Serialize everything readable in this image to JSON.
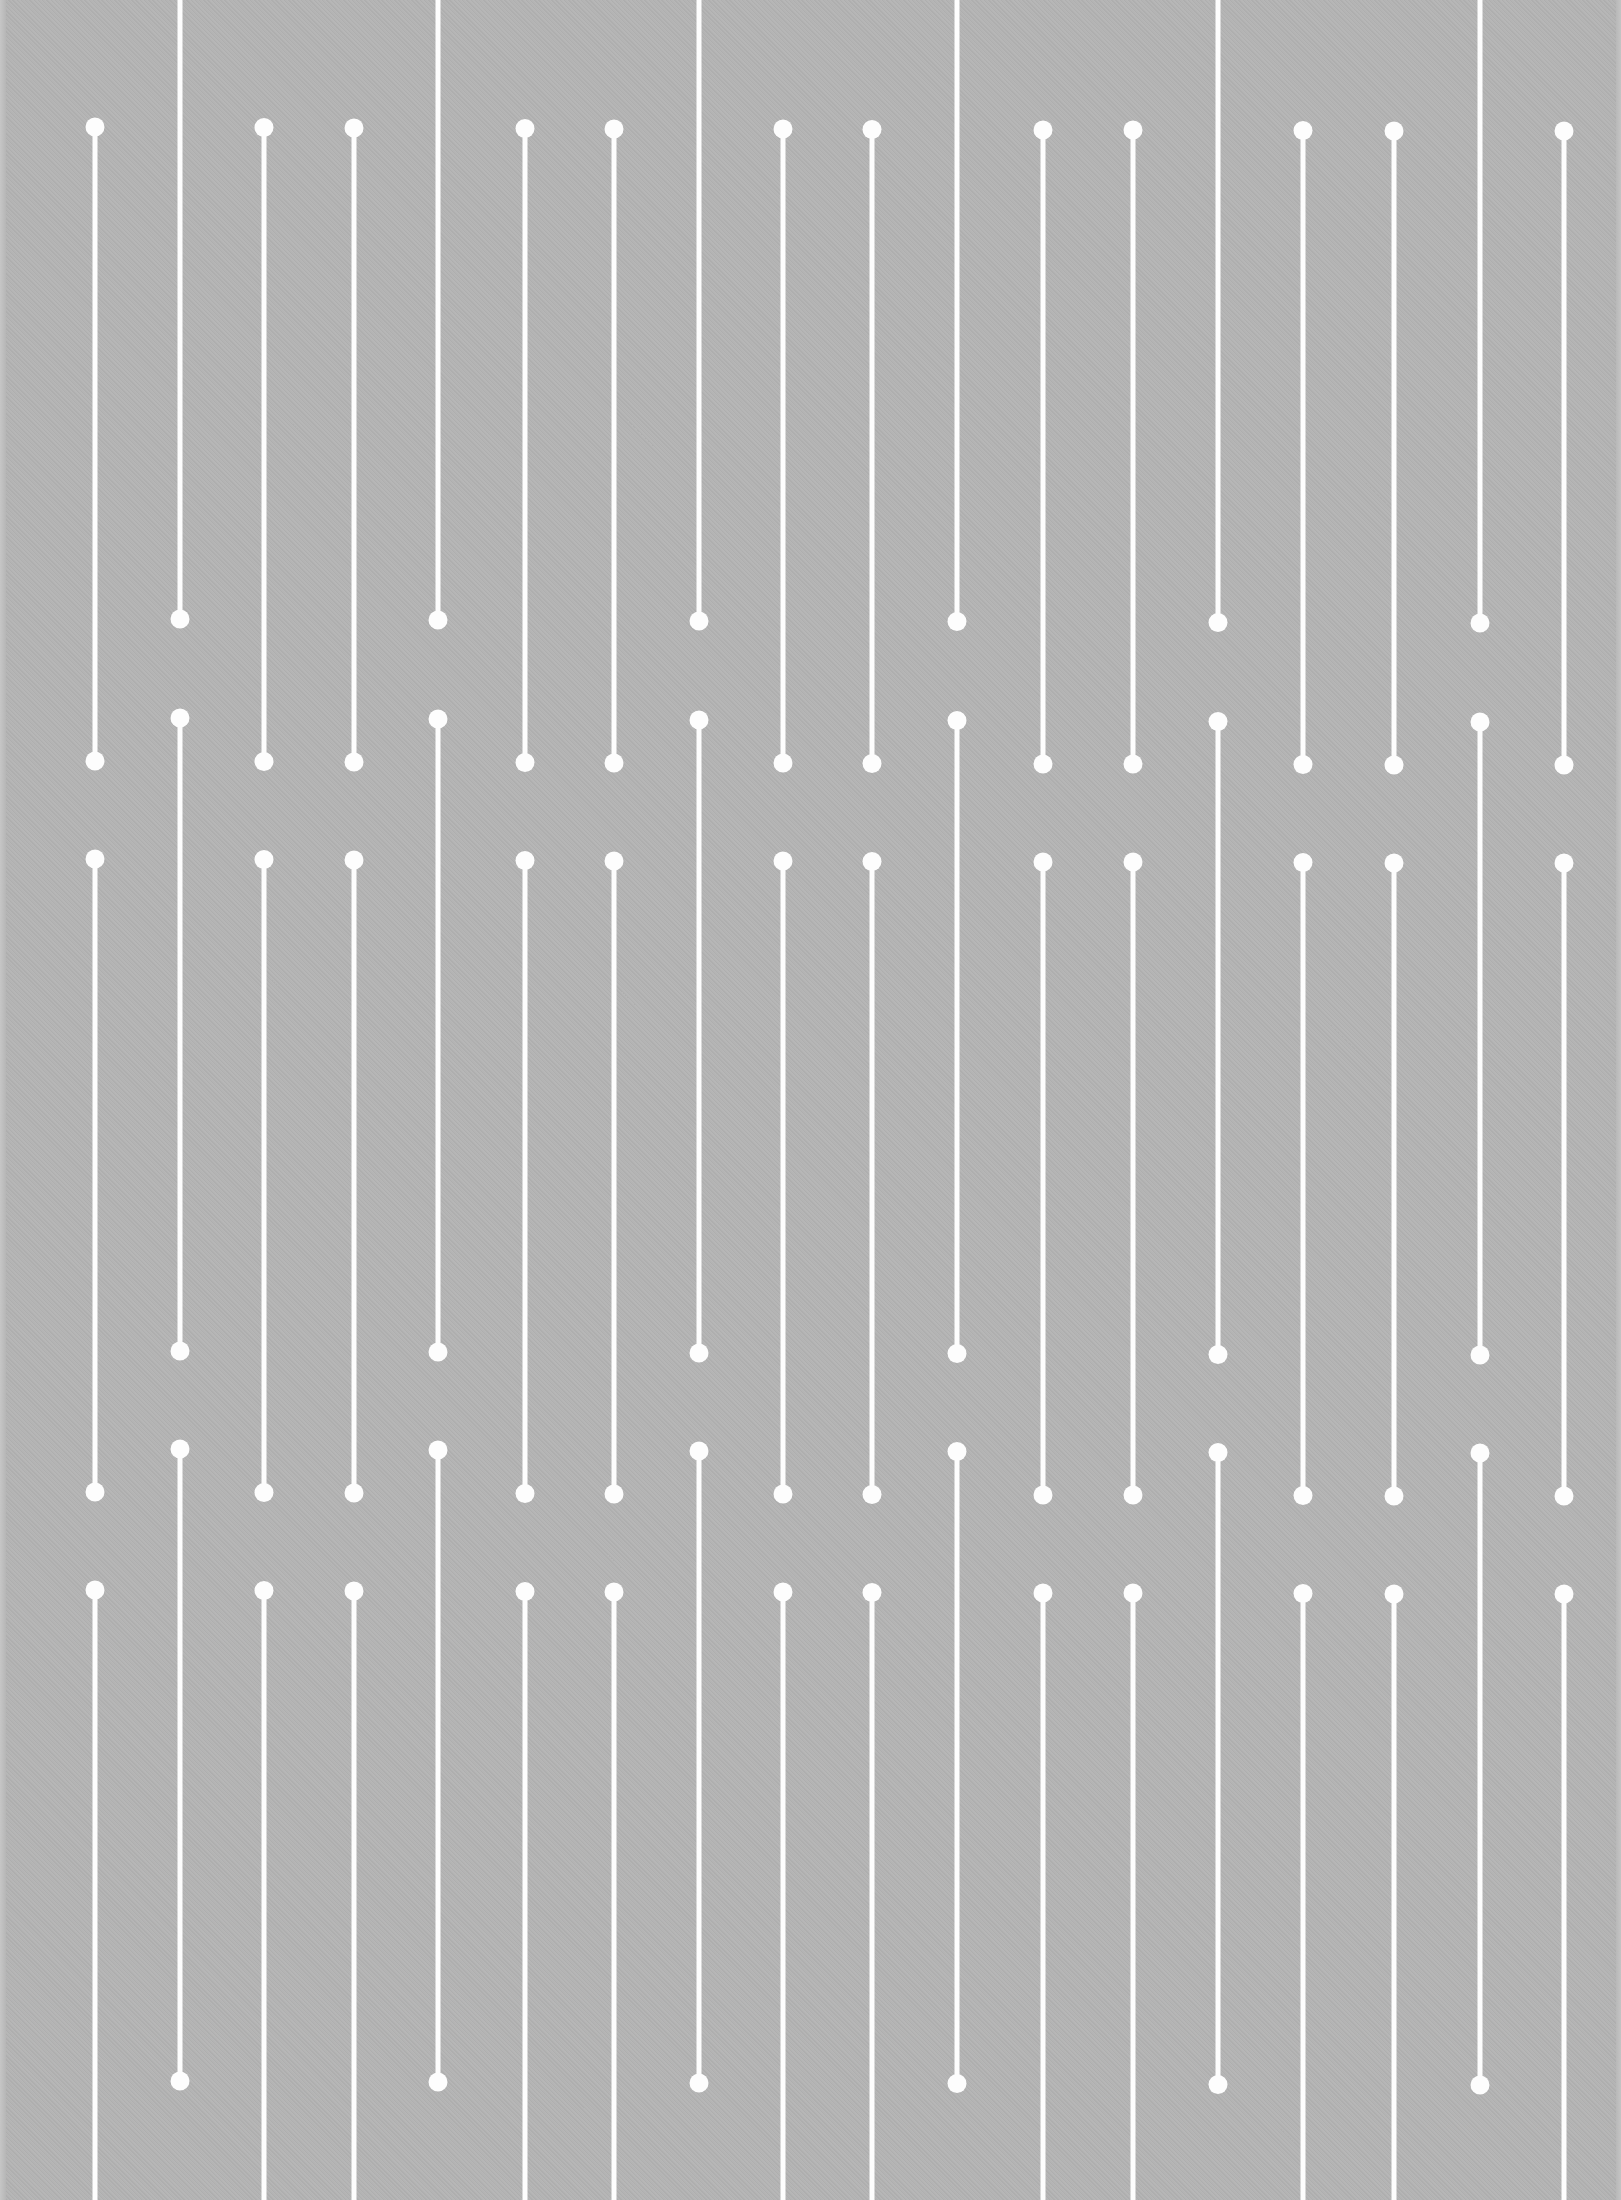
{
  "pattern": {
    "background_color": "#b4b4b4",
    "line_color": "#fdfdfd",
    "line_width": 5,
    "dot_radius": 9.5,
    "short_columns": {
      "x": [
        95,
        264,
        354,
        525,
        614,
        783,
        872,
        1043,
        1133,
        1303,
        1394,
        1564
      ],
      "dy": [
        0,
        0.5,
        1,
        1.5,
        2,
        2,
        2.5,
        3,
        3,
        3.5,
        4,
        4
      ],
      "segments": [
        {
          "top_dot": 127,
          "bottom_dot": 761
        },
        {
          "top_dot": 859,
          "bottom_dot": 1492
        },
        {
          "top_dot": 1590,
          "bottom_dot": null,
          "extends_to_edge": true
        }
      ]
    },
    "long_columns": {
      "x": [
        180,
        438,
        699,
        957,
        1218,
        1480
      ],
      "dy": [
        0,
        1,
        2,
        2.5,
        3.5,
        4
      ],
      "segments": [
        {
          "top_dot": null,
          "extends_from_edge": true,
          "bottom_dot": 619
        },
        {
          "top_dot": 718,
          "bottom_dot": 1351
        },
        {
          "top_dot": 1449,
          "bottom_dot": 2081
        }
      ]
    }
  }
}
